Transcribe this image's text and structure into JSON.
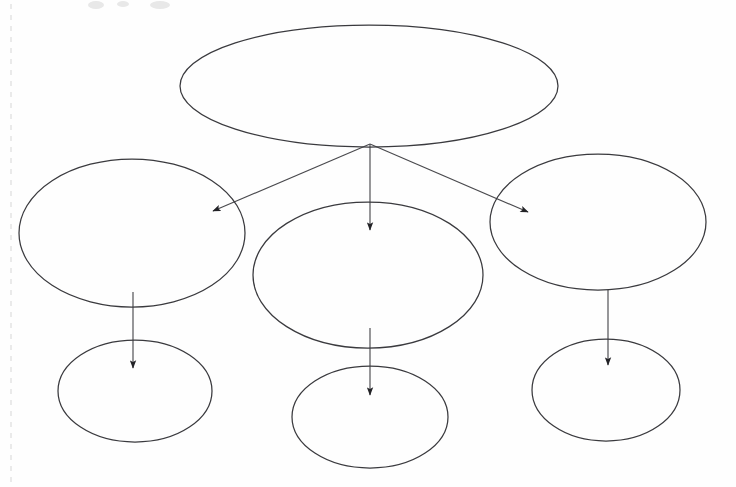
{
  "page": {
    "width": 736,
    "height": 487,
    "background_color": "#fefefe",
    "stroke_color": "#3a3a3e",
    "arrow_color": "#4a4a4e",
    "arrowhead_color": "#222226",
    "scan_artifact_color": "#d6d6d6"
  },
  "diagram": {
    "type": "hierarchy-concept-map",
    "orientation": "top-down",
    "levels": 3,
    "nodes": [
      {
        "id": "root",
        "level": 1,
        "label": "",
        "shape": "ellipse",
        "cx": 369,
        "cy": 86,
        "rx": 189,
        "ry": 61
      },
      {
        "id": "branch-left",
        "level": 2,
        "label": "",
        "shape": "ellipse",
        "cx": 132,
        "cy": 233,
        "rx": 113,
        "ry": 74
      },
      {
        "id": "branch-center",
        "level": 2,
        "label": "",
        "shape": "ellipse",
        "cx": 368,
        "cy": 275,
        "rx": 115,
        "ry": 73
      },
      {
        "id": "branch-right",
        "level": 2,
        "label": "",
        "shape": "ellipse",
        "cx": 598,
        "cy": 222,
        "rx": 108,
        "ry": 68
      },
      {
        "id": "leaf-left",
        "level": 3,
        "label": "",
        "shape": "ellipse",
        "cx": 135,
        "cy": 391,
        "rx": 77,
        "ry": 51
      },
      {
        "id": "leaf-center",
        "level": 3,
        "label": "",
        "shape": "ellipse",
        "cx": 370,
        "cy": 417,
        "rx": 78,
        "ry": 51
      },
      {
        "id": "leaf-right",
        "level": 3,
        "label": "",
        "shape": "ellipse",
        "cx": 606,
        "cy": 390,
        "rx": 74,
        "ry": 51
      }
    ],
    "connectors": [
      {
        "id": "root-to-branch-left",
        "from": "root",
        "to": "branch-left",
        "x1": 370,
        "y1": 144,
        "x2": 213,
        "y2": 211,
        "arrowhead": "end"
      },
      {
        "id": "root-to-branch-center",
        "from": "root",
        "to": "branch-center",
        "x1": 370,
        "y1": 144,
        "x2": 370,
        "y2": 230,
        "arrowhead": "end"
      },
      {
        "id": "root-to-branch-right",
        "from": "root",
        "to": "branch-right",
        "x1": 370,
        "y1": 144,
        "x2": 528,
        "y2": 212,
        "arrowhead": "end"
      },
      {
        "id": "branch-left-to-leaf-left",
        "from": "branch-left",
        "to": "leaf-left",
        "x1": 133,
        "y1": 292,
        "x2": 133,
        "y2": 368,
        "arrowhead": "end"
      },
      {
        "id": "branch-center-to-leaf-center",
        "from": "branch-center",
        "to": "leaf-center",
        "x1": 370,
        "y1": 328,
        "x2": 370,
        "y2": 395,
        "arrowhead": "end"
      },
      {
        "id": "branch-right-to-leaf-right",
        "from": "branch-right",
        "to": "leaf-right",
        "x1": 608,
        "y1": 290,
        "x2": 608,
        "y2": 365,
        "arrowhead": "end"
      }
    ],
    "scan_artifacts": {
      "gutter_line_x": 11,
      "gutter_line_y1": 4,
      "gutter_line_y2": 483,
      "smudges": [
        {
          "cx": 96,
          "cy": 5,
          "rx": 8,
          "ry": 4
        },
        {
          "cx": 123,
          "cy": 4,
          "rx": 6,
          "ry": 3
        },
        {
          "cx": 160,
          "cy": 5,
          "rx": 10,
          "ry": 4
        }
      ]
    }
  }
}
